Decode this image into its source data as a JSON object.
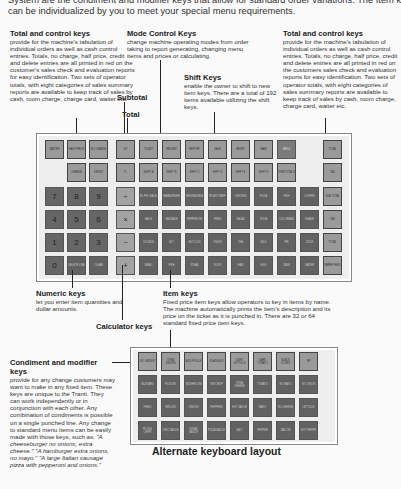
{
  "intro": {
    "line1": "System are the condiment and modifier keys that allow for standard order variations. The Item keys",
    "line2": "can be individualized by you to meet your special menu requirements."
  },
  "callouts": {
    "total_control_left": {
      "title": "Total and control keys",
      "body": "provide for the machine's tabulation of individual orders as well as cash control entries. Totals, no charge, half price, credit and delete entries are all printed in red on the customer's sales check and evaluation reports for easy identification. Two sets of operator totals, with eight categories of sales summary reports are available to keep track of sales by cash, room charge, charge card, waiter etc."
    },
    "mode_control": {
      "title": "Mode Control Keys",
      "body": "change machine operating modes from order taking to report generating, changing menu items and prices or calculating."
    },
    "total_control_right": {
      "title": "Total and control keys",
      "body": "provide for the machine's tabulation of individual orders as well as cash control entries. Totals, no charge, half price, credit and delete entries are all printed in red on the customers sales check and evaluation reports for easy identification. Two sets of operator totals, with eight categories of sales summary reports are available to keep track of sales by cash, room charge, charge card, waiter etc."
    },
    "shift": {
      "title": "Shift Keys",
      "body": "enable the owner to shift to new item keys. There are a total of 192 items available utilizing the shift keys."
    },
    "subtotal": {
      "title": "Subtotal"
    },
    "total": {
      "title": "Total"
    },
    "numeric": {
      "title": "Numeric keys",
      "body": "let you enter item quantities and dollar amounts."
    },
    "calculator": {
      "title": "Calculator keys"
    },
    "item": {
      "title": "Item keys",
      "body": "Fixed price item keys allow operators to key in items by name. The machine automatically prints the item's description and its price on the ticket as it is punched in. There are 32 or 64 standard fixed price item keys."
    },
    "condiment": {
      "title": "Condiment and modifier keys",
      "body_plain": "provide for any change customers may want to make in any fixed item. These keys are unique to the Tranti. They can work independently or in conjunction with each other. Any combination of condiments is possible on a single punched line. Any change to standard menu items can be easily made with those keys, such as:",
      "ex1": "\"A cheeseburger no onions, extra cheese.\"",
      "ex2": "\"A hamburger extra onions, no mayo.\"",
      "ex3": "\"A large Italian sausage pizza with pepperoni and onions.\""
    }
  },
  "main_keyboard": {
    "row1": [
      "WAITER",
      "HALF PRICE",
      "NO CHARGE",
      "S/T",
      "TICKET",
      "REVIEW",
      "REPORT",
      "SALE",
      "RESET",
      "MAIN",
      "MENU",
      "TOTAL"
    ],
    "row2": [
      "CHARGE",
      "CREDIT",
      "TL",
      "SHIFT A",
      "SHIFT B",
      "SHIFT C",
      "SHIFT D",
      "SHIFT E",
      "SHIFT F",
      "SHIFT G",
      "SHIFT H",
      "ITEM TOTALS",
      "TAX"
    ],
    "numeric": [
      "7",
      "8",
      "9",
      "4",
      "5",
      "6",
      "1",
      "2",
      "3",
      "0",
      "DELETE LINE",
      "CLEAR"
    ],
    "calculator": [
      "÷",
      "×",
      "−",
      "+"
    ],
    "items": [
      [
        "BL PR / EACH",
        "HAMBURGER",
        "CHEESEBURGER",
        "ROAST BEEF",
        "CHICKEN",
        "PIZZA",
        "FISH",
        "COFFEE"
      ],
      [
        "EACH",
        "SAUSAGE",
        "PEPPERONI",
        "FRIES",
        "SALAD",
        "SODA",
        "ICE CREAM",
        "SHAKE"
      ],
      [
        "DOUBLE",
        "BLT",
        "HOT DOG",
        "ONION",
        "TEA",
        "MILK",
        "PIE",
        "JUICE"
      ],
      [
        "SMALL",
        "FISH",
        "STEAK",
        "SOUP",
        "HAM",
        "EGG",
        "CAKE",
        "WATER"
      ]
    ],
    "right_col": [
      "SUB TOTAL",
      "TAX",
      "TOTAL",
      "PAPER FEED"
    ]
  },
  "alt_keyboard": {
    "title": "Alternate keyboard layout",
    "rows": [
      [
        "NO CATSUP",
        "XTRA ONIONS",
        "ADD PICKLE",
        "PLAIN BUN",
        "LIGHT LETTUCE",
        "DARK TOMATO",
        "BLACK OLIVES",
        "NP"
      ],
      [
        "MUSTARD",
        "PICKLES",
        "MUSHROOM",
        "KETCHUP",
        "XTRA CHEESE",
        "TOMATO",
        "NO MAYO",
        "NO ONION"
      ],
      [
        "FRIED",
        "GRILLED",
        "ONIONS",
        "PEPPERS",
        "HOT SAUCE",
        "MAYO",
        "NO CHEESE",
        "LETTUCE"
      ],
      [
        "PICKLE CHIPS",
        "CHILI SAUCE",
        "STEAK SAUCE",
        "PIZZA SAUCE",
        "SALT",
        "PEPPER",
        "BACON",
        "HOT PEPPR"
      ]
    ]
  }
}
